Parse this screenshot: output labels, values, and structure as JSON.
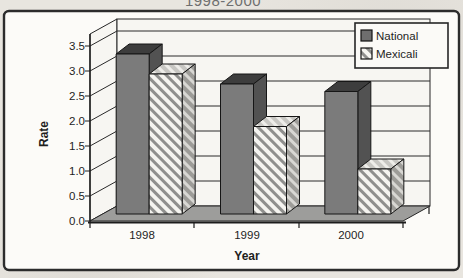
{
  "chart_data": {
    "type": "bar",
    "subtype": "3d-clustered-column",
    "title_fragment": "1998-2000",
    "categories": [
      "1998",
      "1999",
      "2000"
    ],
    "series": [
      {
        "name": "National",
        "values": [
          3.2,
          2.6,
          2.45
        ],
        "appearance": "solid-dark-gray"
      },
      {
        "name": "Mexicali",
        "values": [
          2.8,
          1.75,
          0.9
        ],
        "appearance": "white-diagonal-hatch"
      }
    ],
    "xlabel": "Year",
    "ylabel": "Rate",
    "ylim": [
      0,
      3.5
    ],
    "ytick_step": 0.5,
    "yticks": [
      "3.5",
      "3.0",
      "2.5",
      "2.0",
      "1.5",
      "1.0",
      "0.5",
      "0.0"
    ],
    "grid": true,
    "legend": {
      "position": "top-right",
      "entries": [
        "National",
        "Mexicali"
      ]
    }
  },
  "colors": {
    "national_front": "#7b7b7b",
    "national_top": "#3d3d3d",
    "national_side": "#525252",
    "mexicali_hatch_line": "#8f8f8d",
    "floor": "#9d9d9b",
    "wall": "#f7f6f2",
    "chart_border": "#2c2c2c",
    "page_background": "#e8e5df"
  }
}
